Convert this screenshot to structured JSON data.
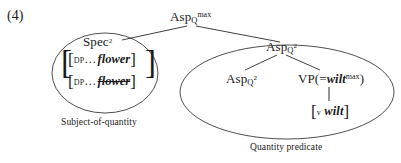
{
  "figure": {
    "number": "(4)"
  },
  "tree": {
    "root": {
      "base": "Asp",
      "subscript": "Q",
      "superscript": "max"
    },
    "spec": {
      "base": "Spec",
      "superscript": "2"
    },
    "spec_brackets": [
      {
        "outer_open": "[",
        "inner_open": "[",
        "label": "DP",
        "dots": "…",
        "word": "flower",
        "struck": false,
        "inner_close": "]",
        "outer_close": "]"
      },
      {
        "outer_open": "[",
        "inner_open": "[",
        "label": "DP",
        "dots": "…",
        "word": "flower",
        "struck": true,
        "inner_close": "]",
        "outer_close": "]"
      }
    ],
    "asp_mid": {
      "base": "Asp",
      "subscript": "Q",
      "superscript": "2"
    },
    "asp_lower": {
      "base": "Asp",
      "subscript": "Q",
      "superscript": "2"
    },
    "vp": {
      "prefix": "VP(=",
      "word": "wilt",
      "superscript": "max",
      "suffix": ")"
    },
    "v_terminal": {
      "open": "[",
      "label": "v",
      "word": "wilt",
      "close": "]"
    }
  },
  "annotations": {
    "left_ellipse_caption": "Subject-of-quantity",
    "right_ellipse_caption": "Quantity predicate"
  },
  "style": {
    "line_color": "#2a2a2a",
    "ellipse_color": "#3a3a3a",
    "text_color": "#1a1a1a"
  }
}
